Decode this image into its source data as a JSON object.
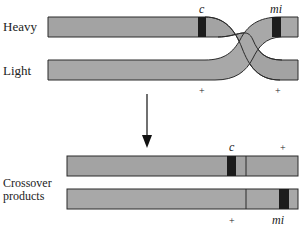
{
  "labels": {
    "heavy": "Heavy",
    "light": "Light",
    "crossover_line1": "Crossover",
    "crossover_line2": "products"
  },
  "markers": {
    "c": "c",
    "mi": "mi",
    "plus": "+"
  },
  "colors": {
    "chromosome_fill": "#a3a3a3",
    "marker_fill": "#1c1c1c",
    "outline": "#2a2a2a",
    "arrow": "#111111"
  }
}
